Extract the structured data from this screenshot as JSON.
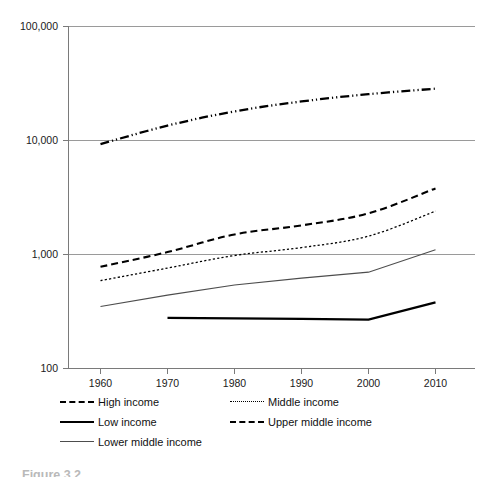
{
  "chart_data": {
    "type": "line",
    "title": "",
    "xlabel": "",
    "ylabel": "",
    "yscale": "log",
    "ylim": [
      100,
      100000
    ],
    "xlim": [
      1960,
      2010
    ],
    "grid": true,
    "legend_position": "bottom-left",
    "x_tick_labels": [
      "1960",
      "1970",
      "1980",
      "1990",
      "2000",
      "2010"
    ],
    "y_tick_labels": [
      "100,000",
      "10,000",
      "1,000",
      "100"
    ],
    "y_tick_values": [
      100000,
      10000,
      1000,
      100
    ],
    "x": [
      1960,
      1970,
      1980,
      1990,
      2000,
      2010
    ],
    "series": [
      {
        "name": "High income",
        "style": "dash-dot-dot",
        "x": [
          1960,
          1970,
          1980,
          1990,
          2000,
          2010
        ],
        "values": [
          9300,
          13500,
          18000,
          22000,
          25500,
          28500
        ]
      },
      {
        "name": "Upper middle income",
        "style": "dashed",
        "x": [
          1960,
          1970,
          1980,
          1990,
          2000,
          2010
        ],
        "values": [
          780,
          1050,
          1500,
          1800,
          2300,
          3800
        ]
      },
      {
        "name": "Middle income",
        "style": "dotted",
        "x": [
          1960,
          1970,
          1980,
          1990,
          2000,
          2010
        ],
        "values": [
          590,
          760,
          980,
          1150,
          1450,
          2400
        ]
      },
      {
        "name": "Lower middle income",
        "style": "solid-thin",
        "x": [
          1960,
          1970,
          1980,
          1990,
          2000,
          2010
        ],
        "values": [
          350,
          440,
          540,
          620,
          700,
          1100
        ]
      },
      {
        "name": "Low income",
        "style": "solid-thick",
        "x": [
          1970,
          1980,
          1990,
          2000,
          2010
        ],
        "values": [
          278,
          275,
          272,
          268,
          380
        ]
      }
    ]
  },
  "legend": {
    "rows": [
      {
        "left": {
          "name": "High income",
          "swatch": "dash-dot-dot-line-icon"
        },
        "right": {
          "name": "Middle income",
          "swatch": "dotted-line-icon"
        }
      },
      {
        "left": {
          "name": "Low income",
          "swatch": "solid-thick-line-icon"
        },
        "right": {
          "name": "Upper middle income",
          "swatch": "dashed-line-icon"
        }
      },
      {
        "left": {
          "name": "Lower middle income",
          "swatch": "solid-thin-line-icon"
        },
        "right": null
      }
    ]
  },
  "caption": {
    "text": "Figure 3.2"
  }
}
